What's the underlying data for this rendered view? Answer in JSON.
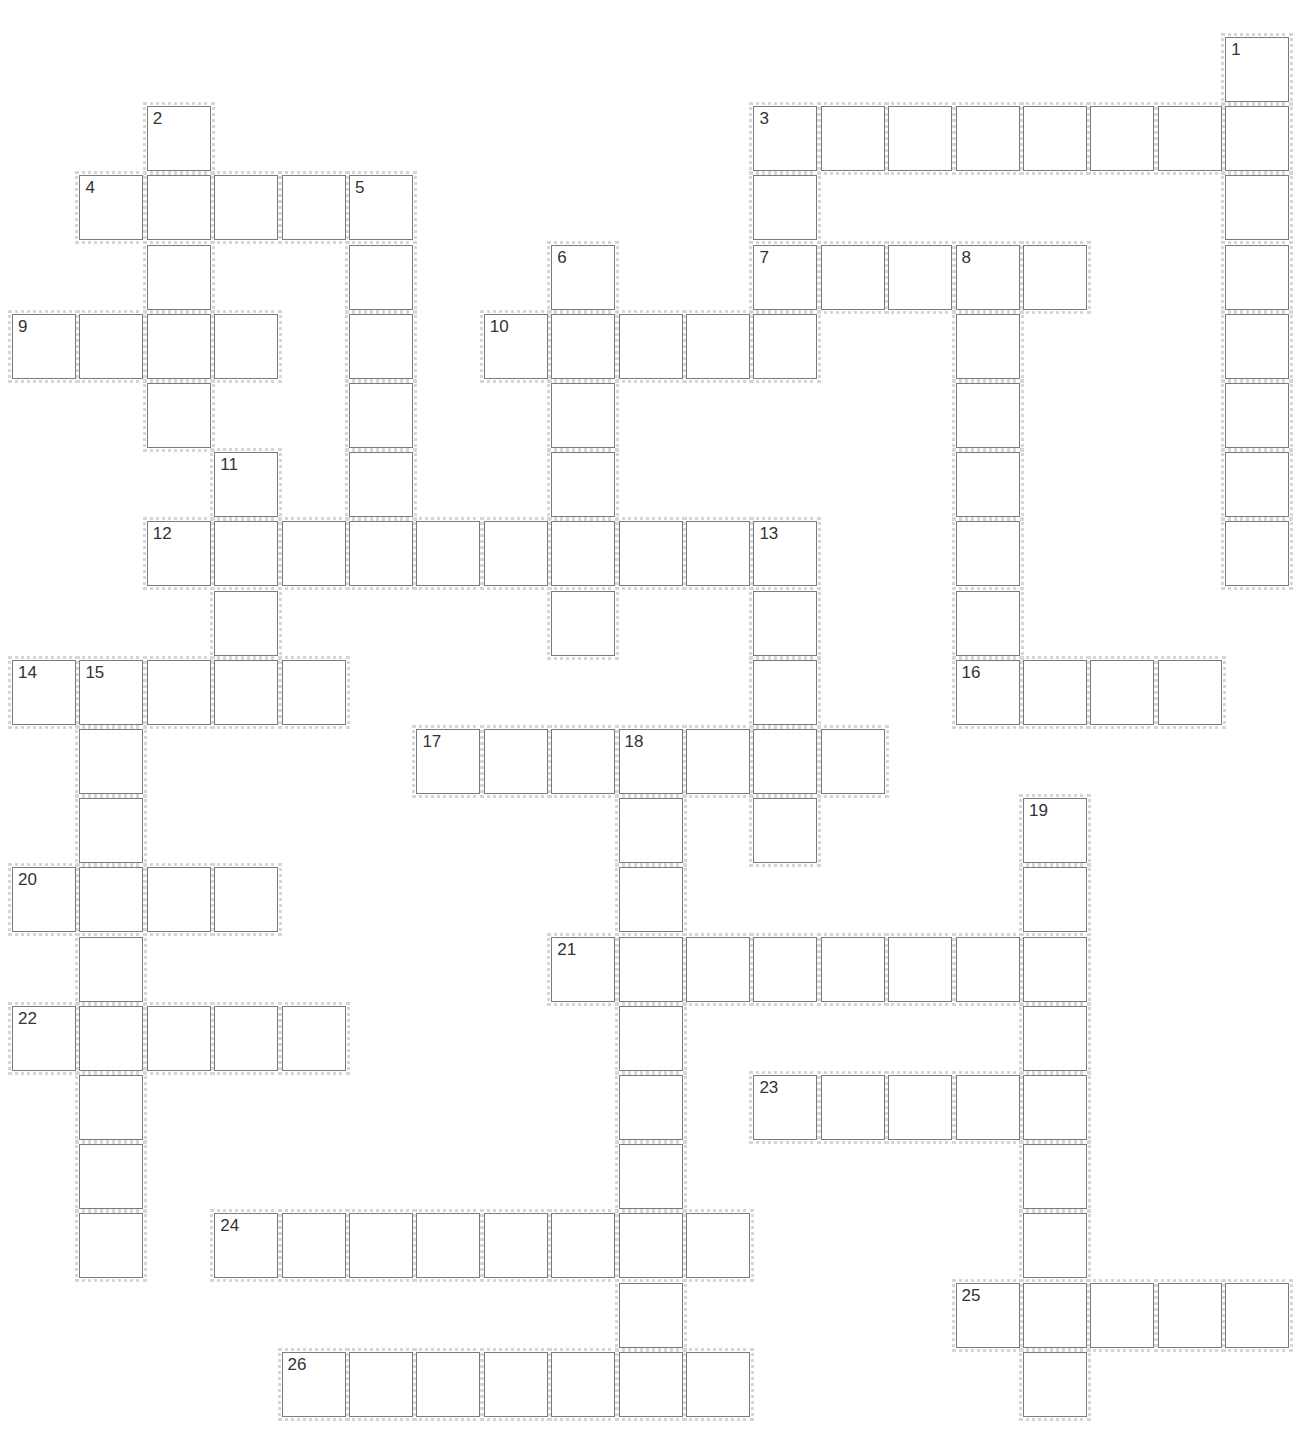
{
  "puzzle": {
    "grid": {
      "origin_x": 12,
      "origin_y": 37,
      "col_pitch": 67.4,
      "row_pitch": 69.2,
      "cols": 19,
      "rows": 20
    },
    "words": [
      {
        "num": "1",
        "dir": "down",
        "row": 0,
        "col": 18,
        "len": 8
      },
      {
        "num": "2",
        "dir": "down",
        "row": 1,
        "col": 2,
        "len": 5
      },
      {
        "num": "3",
        "dir": "across",
        "row": 1,
        "col": 11,
        "len": 8
      },
      {
        "num": "3",
        "dir": "down",
        "row": 1,
        "col": 11,
        "len": 3
      },
      {
        "num": "4",
        "dir": "across",
        "row": 2,
        "col": 1,
        "len": 5
      },
      {
        "num": "5",
        "dir": "down",
        "row": 2,
        "col": 5,
        "len": 5
      },
      {
        "num": "6",
        "dir": "down",
        "row": 3,
        "col": 8,
        "len": 6
      },
      {
        "num": "7",
        "dir": "across",
        "row": 3,
        "col": 11,
        "len": 5
      },
      {
        "num": "8",
        "dir": "down",
        "row": 3,
        "col": 14,
        "len": 7
      },
      {
        "num": "9",
        "dir": "across",
        "row": 4,
        "col": 0,
        "len": 4
      },
      {
        "num": "10",
        "dir": "across",
        "row": 4,
        "col": 7,
        "len": 5
      },
      {
        "num": "11",
        "dir": "down",
        "row": 6,
        "col": 3,
        "len": 3
      },
      {
        "num": "12",
        "dir": "across",
        "row": 7,
        "col": 2,
        "len": 10
      },
      {
        "num": "13",
        "dir": "down",
        "row": 7,
        "col": 11,
        "len": 5
      },
      {
        "num": "14",
        "dir": "across",
        "row": 9,
        "col": 0,
        "len": 5
      },
      {
        "num": "15",
        "dir": "down",
        "row": 9,
        "col": 1,
        "len": 9
      },
      {
        "num": "16",
        "dir": "across",
        "row": 9,
        "col": 14,
        "len": 4
      },
      {
        "num": "17",
        "dir": "across",
        "row": 10,
        "col": 6,
        "len": 7
      },
      {
        "num": "18",
        "dir": "down",
        "row": 10,
        "col": 9,
        "len": 9
      },
      {
        "num": "19",
        "dir": "down",
        "row": 11,
        "col": 15,
        "len": 9
      },
      {
        "num": "20",
        "dir": "across",
        "row": 12,
        "col": 0,
        "len": 4
      },
      {
        "num": "21",
        "dir": "across",
        "row": 13,
        "col": 8,
        "len": 8
      },
      {
        "num": "22",
        "dir": "across",
        "row": 14,
        "col": 0,
        "len": 5
      },
      {
        "num": "23",
        "dir": "across",
        "row": 15,
        "col": 11,
        "len": 5
      },
      {
        "num": "24",
        "dir": "across",
        "row": 17,
        "col": 3,
        "len": 8
      },
      {
        "num": "25",
        "dir": "across",
        "row": 18,
        "col": 14,
        "len": 5
      },
      {
        "num": "26",
        "dir": "across",
        "row": 19,
        "col": 4,
        "len": 7
      }
    ]
  }
}
